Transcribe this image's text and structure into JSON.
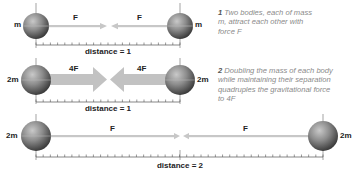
{
  "diagram": {
    "colors": {
      "arrow": "#c7c7c7",
      "arrow_bold": "#c2c2c2",
      "ruler": "#555555",
      "planet_light": "#b0b0b0",
      "planet_dark": "#3a3a3a",
      "caption_text": "#8a8a8a",
      "label_text": "#222222"
    },
    "panels": [
      {
        "id": 1,
        "left_mass": "m",
        "right_mass": "m",
        "left_force": "F",
        "right_force": "F",
        "distance_label": "distance = 1",
        "caption_number": "1",
        "caption_text": "Two bodies, each of mass m, attract each other with force F"
      },
      {
        "id": 2,
        "left_mass": "2m",
        "right_mass": "2m",
        "left_force": "4F",
        "right_force": "4F",
        "distance_label": "distance = 1",
        "caption_number": "2",
        "caption_text": "Doubling the mass of each body while maintaining their separation quadruples the gravitational force to 4F"
      },
      {
        "id": 3,
        "left_mass": "2m",
        "right_mass": "2m",
        "left_force": "F",
        "right_force": "F",
        "distance_label": "distance = 2"
      }
    ]
  }
}
